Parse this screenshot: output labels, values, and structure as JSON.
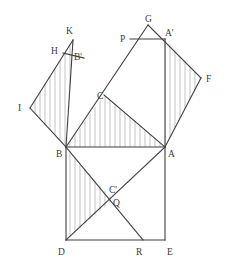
{
  "figure": {
    "canvas": {
      "width": 229,
      "height": 273
    },
    "colors": {
      "stroke": "#3f3f3f",
      "hatch": "#9a9a9a",
      "background": "#ffffff",
      "label": "#3a3a3a"
    },
    "stroke_width": 1.1,
    "hatch_width": 0.6,
    "hatch_spacing": 5
  },
  "points": {
    "A": {
      "label": "A",
      "x": 165,
      "y": 147,
      "lx": 168,
      "ly": 150
    },
    "B": {
      "label": "B",
      "x": 66,
      "y": 147,
      "lx": 56,
      "ly": 150
    },
    "C": {
      "label": "C",
      "x": 104,
      "y": 95,
      "lx": 97,
      "ly": 92
    },
    "D": {
      "label": "D",
      "x": 66,
      "y": 240,
      "lx": 58,
      "ly": 248
    },
    "E": {
      "label": "E",
      "x": 165,
      "y": 240,
      "lx": 167,
      "ly": 248
    },
    "F": {
      "label": "F",
      "x": 201,
      "y": 78,
      "lx": 206,
      "ly": 75
    },
    "G": {
      "label": "G",
      "x": 148,
      "y": 25,
      "lx": 145,
      "ly": 15
    },
    "H": {
      "label": "H",
      "x": 63,
      "y": 53,
      "lx": 51,
      "ly": 47
    },
    "I": {
      "label": "I",
      "x": 30,
      "y": 108,
      "lx": 18,
      "ly": 104
    },
    "K": {
      "label": "K",
      "x": 73,
      "y": 40,
      "lx": 66,
      "ly": 27
    },
    "P": {
      "label": "P",
      "x": 130,
      "y": 39,
      "lx": 120,
      "ly": 35
    },
    "Q": {
      "label": "Q",
      "x": 113,
      "y": 200,
      "lx": 113,
      "ly": 199
    },
    "R": {
      "label": "R",
      "x": 143,
      "y": 240,
      "lx": 136,
      "ly": 248
    },
    "Ap": {
      "label": "A'",
      "x": 165,
      "y": 39,
      "lx": 165,
      "ly": 29
    },
    "Bp": {
      "label": "B'",
      "x": 84,
      "y": 58,
      "lx": 74,
      "ly": 53
    },
    "Cp": {
      "label": "C'",
      "x": 110,
      "y": 187,
      "lx": 109,
      "ly": 186
    }
  },
  "segments": [
    {
      "name": "segment-B-A",
      "from": "B",
      "to": "A"
    },
    {
      "name": "segment-B-D",
      "from": "B",
      "to": "D"
    },
    {
      "name": "segment-D-E",
      "from": "D",
      "to": "E"
    },
    {
      "name": "segment-E-A",
      "from": "E",
      "to": "A"
    },
    {
      "name": "segment-B-Q",
      "from": "B",
      "to": "R"
    },
    {
      "name": "segment-A-D",
      "from": "A",
      "to": "D"
    },
    {
      "name": "segment-B-K",
      "from": "B",
      "to": "K"
    },
    {
      "name": "segment-K-I",
      "from": "K",
      "to": "I"
    },
    {
      "name": "segment-I-B",
      "from": "I",
      "to": "B"
    },
    {
      "name": "segment-H-Bp",
      "from": "H",
      "to": "Bp"
    },
    {
      "name": "segment-B-C",
      "from": "B",
      "to": "G"
    },
    {
      "name": "segment-A-Ap",
      "from": "A",
      "to": "Ap"
    },
    {
      "name": "segment-G-F",
      "from": "G",
      "to": "F"
    },
    {
      "name": "segment-F-A",
      "from": "F",
      "to": "A"
    },
    {
      "name": "segment-P-Ap",
      "from": "P",
      "to": "Ap"
    },
    {
      "name": "segment-C-A",
      "from": "C",
      "to": "A"
    }
  ],
  "hatched_regions": [
    {
      "name": "hatch-left-square-I-K-B",
      "polygon": "I,K,B",
      "direction": "vertical"
    },
    {
      "name": "hatch-middle-B-C-A",
      "polygon": "B,C,A",
      "direction": "vertical"
    },
    {
      "name": "hatch-right-Ap-F-A",
      "polygon": "Ap,F,A",
      "direction": "vertical"
    },
    {
      "name": "hatch-bottom-B-Q-D",
      "polygon": "B,Q,D",
      "direction": "vertical"
    }
  ],
  "labels_order": [
    "K",
    "G",
    "Ap",
    "P",
    "H",
    "Bp",
    "F",
    "C",
    "I",
    "B",
    "A",
    "Cp",
    "Q",
    "D",
    "R",
    "E"
  ]
}
